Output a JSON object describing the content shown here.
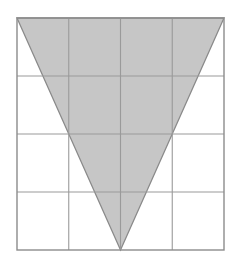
{
  "figure": {
    "type": "geometry-diagram",
    "canvas": {
      "width": 241,
      "height": 279,
      "background": "#ffffff"
    },
    "square": {
      "name": "grid-square",
      "left": 17,
      "top": 18,
      "right": 224,
      "bottom": 250,
      "width": 207,
      "height": 232,
      "border_color": "#8c8c8c",
      "border_width": 1.4,
      "fill": "#ffffff"
    },
    "grid": {
      "columns": 4,
      "rows": 4,
      "cell_width": 51.75,
      "cell_height": 58,
      "line_color": "#9a9a9a",
      "line_width": 1.1,
      "vertical_x": [
        68.75,
        120.5,
        172.25
      ],
      "horizontal_y": [
        76,
        134,
        192
      ]
    },
    "triangle": {
      "name": "shaded-triangle",
      "vertices": [
        {
          "label": "top-left",
          "x": 17,
          "y": 18
        },
        {
          "label": "top-right",
          "x": 224,
          "y": 18
        },
        {
          "label": "bottom-apex",
          "x": 120.5,
          "y": 250
        }
      ],
      "fill": "#c6c6c6",
      "stroke": "#8a8a8a",
      "stroke_width": 1.3,
      "base_cells": 4,
      "height_cells": 4
    }
  }
}
